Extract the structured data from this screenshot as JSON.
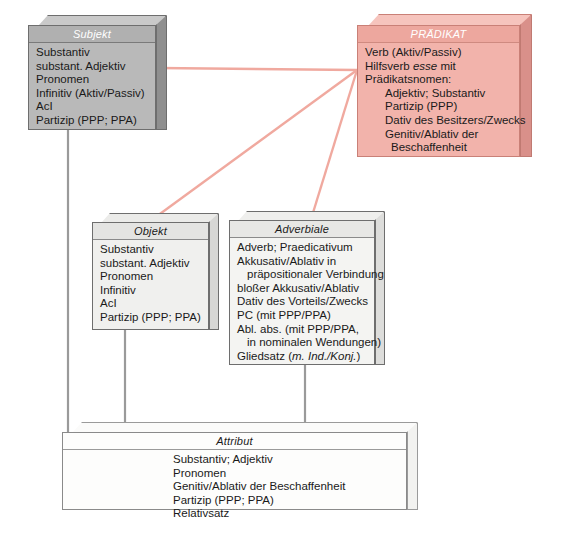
{
  "diagram": {
    "background_color": "#ffffff",
    "link_color_primary": "#f0a99f",
    "link_color_secondary": "#9a9a9a"
  },
  "boxes": {
    "subjekt": {
      "header": "Subjekt",
      "fill_color": "#b9b9b9",
      "lines": [
        "Substantiv",
        "substant. Adjektiv",
        "Pronomen",
        "Infinitiv (Aktiv/Passiv)",
        "AcI",
        "Partizip (PPP; PPA)"
      ]
    },
    "praedikat": {
      "header": "PRÄDIKAT",
      "fill_color": "#f2b3ab",
      "lines": [
        "Verb (Aktiv/Passiv)",
        "Hilfsverb esse mit",
        "Prädikatsnomen:",
        "Adjektiv; Substantiv",
        "Partizip (PPP)",
        "Dativ des Besitzers/Zwecks",
        "Genitiv/Ablativ der",
        "Beschaffenheit"
      ],
      "italic_word": "esse"
    },
    "objekt": {
      "header": "Objekt",
      "fill_color": "#f0f0ee",
      "lines": [
        "Substantiv",
        "substant. Adjektiv",
        "Pronomen",
        "Infinitiv",
        "AcI",
        "Partizip (PPP; PPA)"
      ]
    },
    "adverbiale": {
      "header": "Adverbiale",
      "fill_color": "#f4f4f2",
      "lines": [
        "Adverb; Praedicativum",
        "Akkusativ/Ablativ in",
        "präpositionaler Verbindung",
        "bloßer Akkusativ/Ablativ",
        "Dativ des Vorteils/Zwecks",
        "PC (mit PPP/PPA)",
        "Abl. abs. (mit PPP/PPA,",
        "in nominalen Wendungen)",
        "Gliedsatz (m. Ind./Konj.)"
      ],
      "italic_word": "m. Ind./Konj."
    },
    "attribut": {
      "header": "Attribut",
      "fill_color": "#fdfdfc",
      "lines": [
        "Substantiv; Adjektiv",
        "Pronomen",
        "Genitiv/Ablativ der Beschaffenheit",
        "Partizip (PPP; PPA)",
        "Relativsatz"
      ]
    }
  },
  "connections": [
    {
      "name": "praedikat-to-subjekt",
      "from": "praedikat",
      "to": "subjekt",
      "color": "#f0a99f"
    },
    {
      "name": "praedikat-to-objekt",
      "from": "praedikat",
      "to": "objekt",
      "color": "#f0a99f"
    },
    {
      "name": "praedikat-to-adverbiale",
      "from": "praedikat",
      "to": "adverbiale",
      "color": "#f0a99f"
    },
    {
      "name": "subjekt-to-attribut",
      "from": "subjekt",
      "to": "attribut",
      "color": "#9a9a9a"
    },
    {
      "name": "objekt-to-attribut",
      "from": "objekt",
      "to": "attribut",
      "color": "#9a9a9a"
    },
    {
      "name": "adverbiale-to-attribut",
      "from": "adverbiale",
      "to": "attribut",
      "color": "#9a9a9a"
    }
  ]
}
